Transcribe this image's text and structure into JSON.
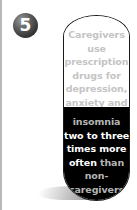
{
  "badge": {
    "number": "5",
    "color": "#3a3a3a"
  },
  "panel": {
    "top_lines": [
      "Caregivers",
      "use",
      "prescription",
      "drugs for",
      "depression,",
      "anxiety and"
    ],
    "bottom_lines": [
      {
        "parts": [
          {
            "text": "insomnia",
            "style": "grey"
          }
        ]
      },
      {
        "parts": [
          {
            "text": "two to three",
            "style": "white"
          }
        ]
      },
      {
        "parts": [
          {
            "text": "times more",
            "style": "white"
          }
        ]
      },
      {
        "parts": [
          {
            "text": "often",
            "style": "white"
          },
          {
            "text": " than",
            "style": "grey"
          }
        ]
      },
      {
        "parts": [
          {
            "text": "non-",
            "style": "grey"
          }
        ]
      },
      {
        "parts": [
          {
            "text": "caregivers",
            "style": "grey"
          }
        ]
      }
    ],
    "colors": {
      "top_bg": "#ffffff",
      "bottom_bg": "#000000",
      "muted_text": "#b5b5b5",
      "highlight_text": "#ffffff"
    }
  }
}
